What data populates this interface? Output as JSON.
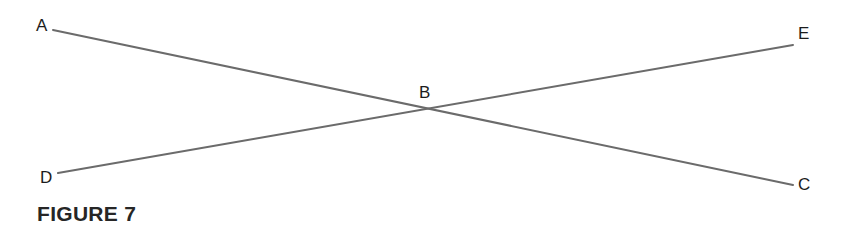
{
  "figure": {
    "caption": "FIGURE 7",
    "background_color": "#ffffff",
    "line_color": "#6b6b6b",
    "label_color": "#1c1c1c",
    "caption_color": "#262626",
    "width": 851,
    "height": 249
  },
  "labels": {
    "a": "A",
    "b": "B",
    "c": "C",
    "d": "D",
    "e": "E"
  },
  "chart_data": {
    "type": "diagram",
    "title": "FIGURE 7",
    "points": [
      {
        "name": "A",
        "x": 53,
        "y": 30
      },
      {
        "name": "B",
        "x": 429,
        "y": 109
      },
      {
        "name": "C",
        "x": 793,
        "y": 185
      },
      {
        "name": "D",
        "x": 58,
        "y": 173
      },
      {
        "name": "E",
        "x": 793,
        "y": 45
      }
    ],
    "segments": [
      {
        "name": "AC",
        "from": "A",
        "to": "C",
        "x1": 53,
        "y1": 30,
        "x2": 793,
        "y2": 185
      },
      {
        "name": "DE",
        "from": "D",
        "to": "E",
        "x1": 58,
        "y1": 173,
        "x2": 793,
        "y2": 45
      }
    ],
    "intersection": {
      "name": "B",
      "x": 429,
      "y": 109
    },
    "stroke_width": 2,
    "grid": false,
    "legend": false
  }
}
